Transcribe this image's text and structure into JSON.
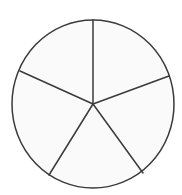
{
  "figure": {
    "title": "Circle divided into five sectors",
    "caption": "",
    "shape_name": "circle",
    "sector_count": "5",
    "background_color": "#ffffff",
    "fill_color": "#fafafa",
    "stroke_color": "#3a3a3a",
    "stroke_width": "1.5"
  },
  "geometry": {
    "center_x": "93",
    "center_y": "104",
    "radius_x": "81",
    "radius_y": "84",
    "view_width": "182",
    "view_height": "195"
  },
  "sectors": [
    {
      "id": "sector-top-left",
      "label": "",
      "start_angle_deg": "90",
      "end_angle_deg": "155",
      "fill": "#fafafa"
    },
    {
      "id": "sector-left",
      "label": "",
      "start_angle_deg": "155",
      "end_angle_deg": "238",
      "fill": "#fafafa"
    },
    {
      "id": "sector-bottom",
      "label": "",
      "start_angle_deg": "238",
      "end_angle_deg": "306",
      "fill": "#fafafa"
    },
    {
      "id": "sector-bottom-right",
      "label": "",
      "start_angle_deg": "306",
      "end_angle_deg": "20",
      "fill": "#fafafa"
    },
    {
      "id": "sector-top-right",
      "label": "",
      "start_angle_deg": "20",
      "end_angle_deg": "90",
      "fill": "#fafafa"
    }
  ],
  "radii": [
    {
      "id": "radius-up",
      "angle_deg": "90",
      "end_x": "93",
      "end_y": "20"
    },
    {
      "id": "radius-upper-left",
      "angle_deg": "155",
      "end_x": "20",
      "end_y": "71"
    },
    {
      "id": "radius-lower-left",
      "angle_deg": "238",
      "end_x": "49",
      "end_y": "175"
    },
    {
      "id": "radius-lower-right",
      "angle_deg": "306",
      "end_x": "143",
      "end_y": "173"
    },
    {
      "id": "radius-right",
      "angle_deg": "20",
      "end_x": "169",
      "end_y": "76"
    }
  ]
}
